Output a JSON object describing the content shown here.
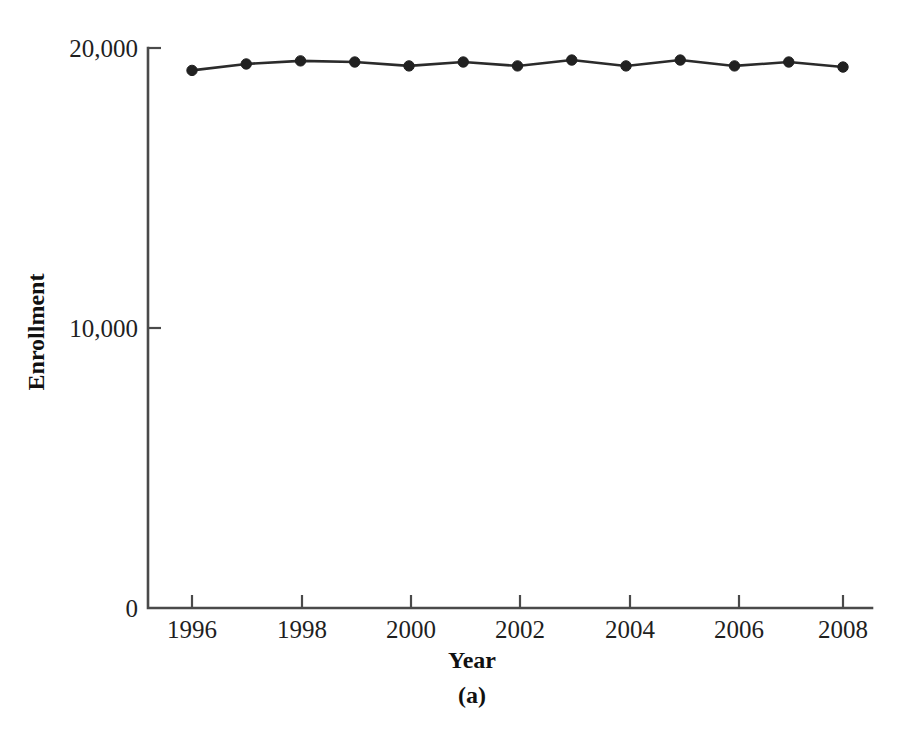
{
  "figure": {
    "caption": "(a)",
    "background_color": "#ffffff"
  },
  "chart_data": {
    "type": "line",
    "title": "",
    "subtitle": "",
    "xlabel": "Year",
    "ylabel": "Enrollment",
    "x": [
      1996,
      1997,
      1998,
      1999,
      2000,
      2001,
      2002,
      2003,
      2004,
      2005,
      2006,
      2007,
      2008
    ],
    "values": [
      19200,
      19430,
      19540,
      19500,
      19360,
      19500,
      19360,
      19570,
      19360,
      19570,
      19360,
      19500,
      19320
    ],
    "series": [
      {
        "name": "Enrollment",
        "values": [
          19200,
          19430,
          19540,
          19500,
          19360,
          19500,
          19360,
          19570,
          19360,
          19570,
          19360,
          19500,
          19320
        ],
        "color": "#212121",
        "marker": "circle"
      }
    ],
    "xlim": [
      1995.2,
      1908.7
    ],
    "ylim": [
      0,
      20000
    ],
    "x_tick_labels": [
      "1996",
      "1998",
      "2000",
      "2002",
      "2004",
      "2006",
      "2008"
    ],
    "x_tick_values": [
      1996,
      1998,
      2000,
      2002,
      2004,
      2006,
      2008
    ],
    "y_tick_labels": [
      "0",
      "10,000",
      "20,000"
    ],
    "y_tick_values": [
      0,
      10000,
      20000
    ],
    "grid": false,
    "legend": "none",
    "line_color": "#2b2b2b",
    "axis_color": "#4a4a4a"
  }
}
